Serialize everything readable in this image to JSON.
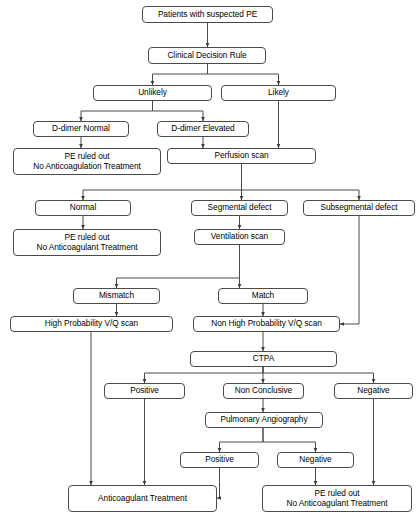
{
  "diagram": {
    "background_color": "#ffffff",
    "box_border_color": "#4a4a4a",
    "box_fill_color": "#ffffff",
    "text_color": "#000000",
    "edge_color": "#4a4a4a"
  },
  "nodes": [
    {
      "id": "suspected_pe",
      "label": "Patients with suspected PE",
      "x": 142,
      "y": 6,
      "w": 131,
      "h": 17
    },
    {
      "id": "clinical_rule",
      "label": "Clinical Decision Rule",
      "x": 148,
      "y": 47,
      "w": 118,
      "h": 17
    },
    {
      "id": "unlikely",
      "label": "Unlikely",
      "x": 93,
      "y": 85,
      "w": 119,
      "h": 16
    },
    {
      "id": "likely",
      "label": "Likely",
      "x": 221,
      "y": 85,
      "w": 115,
      "h": 16
    },
    {
      "id": "ddimer_normal",
      "label": "D-dimer Normal",
      "x": 33,
      "y": 121,
      "w": 96,
      "h": 16
    },
    {
      "id": "ddimer_elevated",
      "label": "D-dimer Elevated",
      "x": 157,
      "y": 121,
      "w": 92,
      "h": 16
    },
    {
      "id": "ruled_out_1",
      "label": "PE ruled out\nNo Anticoagulation Treatment",
      "x": 13,
      "y": 148,
      "w": 148,
      "h": 27
    },
    {
      "id": "perfusion_scan",
      "label": "Perfusion scan",
      "x": 167,
      "y": 148,
      "w": 149,
      "h": 16
    },
    {
      "id": "normal",
      "label": "Normal",
      "x": 35,
      "y": 200,
      "w": 96,
      "h": 16
    },
    {
      "id": "segmental_defect",
      "label": "Segmental defect",
      "x": 191,
      "y": 200,
      "w": 97,
      "h": 16
    },
    {
      "id": "subsegmental_defect",
      "label": "Subsegmental defect",
      "x": 303,
      "y": 200,
      "w": 112,
      "h": 16
    },
    {
      "id": "ruled_out_2",
      "label": "PE ruled out\nNo Anticoagulant Treatment",
      "x": 13,
      "y": 229,
      "w": 148,
      "h": 27
    },
    {
      "id": "ventilation_scan",
      "label": "Ventilation scan",
      "x": 194,
      "y": 229,
      "w": 91,
      "h": 16
    },
    {
      "id": "mismatch",
      "label": "Mismatch",
      "x": 73,
      "y": 288,
      "w": 87,
      "h": 16
    },
    {
      "id": "match",
      "label": "Match",
      "x": 218,
      "y": 288,
      "w": 90,
      "h": 16
    },
    {
      "id": "high_prob_vq",
      "label": "High Probability V/Q scan",
      "x": 10,
      "y": 316,
      "w": 163,
      "h": 16
    },
    {
      "id": "non_high_prob_vq",
      "label": "Non High Probability V/Q scan",
      "x": 193,
      "y": 316,
      "w": 147,
      "h": 16
    },
    {
      "id": "ctpa",
      "label": "CTPA",
      "x": 190,
      "y": 351,
      "w": 147,
      "h": 16
    },
    {
      "id": "ctpa_positive",
      "label": "Positive",
      "x": 104,
      "y": 383,
      "w": 81,
      "h": 16
    },
    {
      "id": "ctpa_nonconclusive",
      "label": "Non Conclusive",
      "x": 223,
      "y": 383,
      "w": 81,
      "h": 16
    },
    {
      "id": "ctpa_negative",
      "label": "Negative",
      "x": 334,
      "y": 383,
      "w": 79,
      "h": 16
    },
    {
      "id": "pulm_angiography",
      "label": "Pulmonary Angiography",
      "x": 205,
      "y": 412,
      "w": 118,
      "h": 16
    },
    {
      "id": "angio_positive",
      "label": "Positive",
      "x": 180,
      "y": 452,
      "w": 79,
      "h": 16
    },
    {
      "id": "angio_negative",
      "label": "Negative",
      "x": 277,
      "y": 452,
      "w": 77,
      "h": 16
    },
    {
      "id": "anticoag_treatment",
      "label": "Anticoagulant Treatment",
      "x": 68,
      "y": 485,
      "w": 149,
      "h": 27
    },
    {
      "id": "ruled_out_3",
      "label": "PE ruled out\nNo Anticoagulant Treatment",
      "x": 262,
      "y": 485,
      "w": 150,
      "h": 27
    }
  ],
  "edges": [
    {
      "from": "suspected_pe",
      "to": "clinical_rule",
      "path": "M 207.5 23 L 207.5 47"
    },
    {
      "from": "clinical_rule",
      "to": "unlikely",
      "path": "M 207.5 64 L 207.5 74 L 152.5 74 L 152.5 85"
    },
    {
      "from": "clinical_rule",
      "to": "likely",
      "path": "M 207.5 64 L 207.5 74 L 278.5 74 L 278.5 85"
    },
    {
      "from": "unlikely",
      "to": "ddimer_normal",
      "path": "M 152.5 101 L 152.5 111 L 81 111 L 81 121"
    },
    {
      "from": "unlikely",
      "to": "ddimer_elevated",
      "path": "M 152.5 101 L 152.5 111 L 203 111 L 203 121"
    },
    {
      "from": "ddimer_normal",
      "to": "ruled_out_1",
      "path": "M 81 137 L 81 148"
    },
    {
      "from": "ddimer_elevated",
      "to": "perfusion_scan",
      "path": "M 203 137 L 203 148"
    },
    {
      "from": "likely",
      "to": "perfusion_scan",
      "path": "M 278.5 101 L 278.5 148"
    },
    {
      "from": "perfusion_scan",
      "to": "normal",
      "path": "M 241.5 164 L 241.5 190 L 83 190 L 83 200"
    },
    {
      "from": "perfusion_scan",
      "to": "segmental_defect",
      "path": "M 241.5 164 L 241.5 200"
    },
    {
      "from": "perfusion_scan",
      "to": "subsegmental_defect",
      "path": "M 241.5 164 L 241.5 190 L 359 190 L 359 200"
    },
    {
      "from": "normal",
      "to": "ruled_out_2",
      "path": "M 83 216 L 83 229"
    },
    {
      "from": "segmental_defect",
      "to": "ventilation_scan",
      "path": "M 239.5 216 L 239.5 229"
    },
    {
      "from": "ventilation_scan",
      "to": "mismatch",
      "path": "M 239.5 245 L 239.5 278 L 116.5 278 L 116.5 288"
    },
    {
      "from": "ventilation_scan",
      "to": "match",
      "path": "M 239.5 245 L 239.5 288"
    },
    {
      "from": "mismatch",
      "to": "high_prob_vq",
      "path": "M 116.5 304 L 116.5 316"
    },
    {
      "from": "match",
      "to": "non_high_prob_vq",
      "path": "M 263 304 L 263 316"
    },
    {
      "from": "subsegmental_defect",
      "to": "non_high_prob_vq",
      "path": "M 359 216 L 359 324 L 340 324"
    },
    {
      "from": "non_high_prob_vq",
      "to": "ctpa",
      "path": "M 263 332 L 263 351"
    },
    {
      "from": "ctpa",
      "to": "ctpa_positive",
      "path": "M 263 367 L 263 373 L 144.5 373 L 144.5 383"
    },
    {
      "from": "ctpa",
      "to": "ctpa_nonconclusive",
      "path": "M 263 367 L 263 383"
    },
    {
      "from": "ctpa",
      "to": "ctpa_negative",
      "path": "M 263 367 L 263 373 L 373.5 373 L 373.5 383"
    },
    {
      "from": "ctpa_nonconclusive",
      "to": "pulm_angiography",
      "path": "M 263 399 L 263 412"
    },
    {
      "from": "pulm_angiography",
      "to": "angio_positive",
      "path": "M 263 428 L 263 442 L 219.5 442 L 219.5 452"
    },
    {
      "from": "pulm_angiography",
      "to": "angio_negative",
      "path": "M 263 428 L 263 442 L 315.5 442 L 315.5 452"
    },
    {
      "from": "high_prob_vq",
      "to": "anticoag_treatment",
      "path": "M 91 332 L 91 485"
    },
    {
      "from": "ctpa_positive",
      "to": "anticoag_treatment",
      "path": "M 144.5 399 L 144.5 485"
    },
    {
      "from": "angio_positive",
      "to": "anticoag_treatment",
      "path": "M 219.5 468 L 219.5 498 L 217 498"
    },
    {
      "from": "angio_negative",
      "to": "ruled_out_3",
      "path": "M 315.5 468 L 315.5 485"
    },
    {
      "from": "ctpa_negative",
      "to": "ruled_out_3",
      "path": "M 373.5 399 L 373.5 485"
    }
  ],
  "caption": {
    "text": ""
  }
}
